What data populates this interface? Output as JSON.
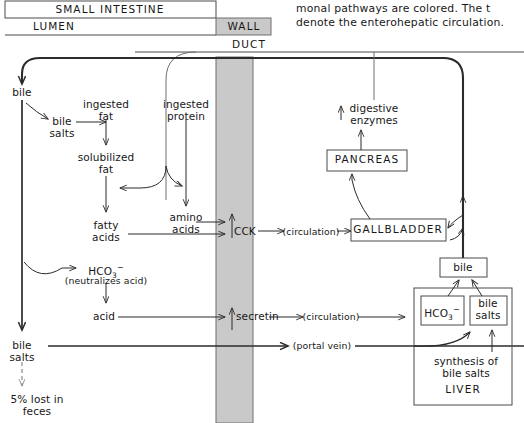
{
  "figure": {
    "caption_lines": [
      "monal pathways are colored. The t",
      "denote the enterohepatic circulation."
    ]
  },
  "colors": {
    "wall_fill": "#c9c9c9",
    "wall_stroke": "#6e6e6e",
    "line": "#2b2b2b",
    "box_stroke": "#4a4a4a",
    "background": "#ffffff",
    "dashed": "#8a8a8a"
  },
  "headers": {
    "small_intestine": "SMALL INTESTINE",
    "lumen": "LUMEN",
    "wall": "WALL",
    "duct": "DUCT"
  },
  "nodes": {
    "bile_top": "bile",
    "ingested_fat": "ingested\nfat",
    "ingested_protein": "ingested\nprotein",
    "bile_salts_lumen": "bile\nsalts",
    "solubilized_fat": "solubilized\nfat",
    "fatty_acids": "fatty\nacids",
    "amino_acids": "amino\nacids",
    "hco3_lumen": "HCO3⁻",
    "hco3_note": "(neutralizes acid)",
    "acid": "acid",
    "bile_salts_bottom": "bile\nsalts",
    "lost": "5% lost in\nfeces",
    "cck": "CCK",
    "secretin": "secretin",
    "circulation_cck": "(circulation)",
    "circulation_secretin": "(circulation)",
    "portal_vein": "(portal vein)",
    "digestive_enzymes": "digestive\nenzymes",
    "pancreas": "PANCREAS",
    "gallbladder": "GALLBLADDER",
    "bile_liver": "bile",
    "hco3_liver": "HCO3⁻",
    "bile_salts_liver": "bile\nsalts",
    "synthesis": "synthesis of\nbile salts",
    "liver": "LIVER"
  },
  "text_parts": {
    "ingested_fat_1": "ingested",
    "ingested_fat_2": "fat",
    "ingested_protein_1": "ingested",
    "ingested_protein_2": "protein",
    "bile_salts_1": "bile",
    "bile_salts_2": "salts",
    "solubilized_1": "solubilized",
    "solubilized_2": "fat",
    "fatty_1": "fatty",
    "fatty_2": "acids",
    "amino_1": "amino",
    "amino_2": "acids",
    "lost_1": "5% lost in",
    "lost_2": "feces",
    "enzymes_1": "digestive",
    "enzymes_2": "enzymes",
    "synthesis_1": "synthesis of",
    "synthesis_2": "bile salts",
    "hco3_main": "HCO",
    "hco3_sub": "3",
    "hco3_sup": "−"
  }
}
